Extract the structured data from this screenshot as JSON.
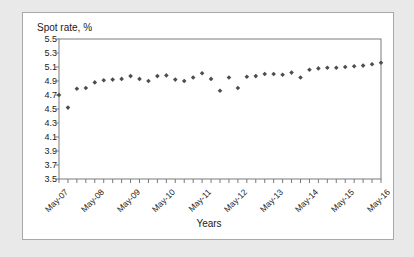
{
  "chart_data": {
    "type": "scatter",
    "title": "",
    "ylabel": "Spot rate, %",
    "xlabel": "Years",
    "ylim": [
      3.5,
      5.5
    ],
    "ytick_labels": [
      "5.5",
      "5.3",
      "5.1",
      "4.9",
      "4.7",
      "4.5",
      "4.3",
      "4.1",
      "3.9",
      "3.7",
      "3.5"
    ],
    "ytick_values": [
      5.5,
      5.3,
      5.1,
      4.9,
      4.7,
      4.5,
      4.3,
      4.1,
      3.9,
      3.7,
      3.5
    ],
    "xtick_labels": [
      "May-07",
      "May-08",
      "May-09",
      "May-10",
      "May-11",
      "May-12",
      "May-13",
      "May-14",
      "May-15",
      "May-16"
    ],
    "grid": false,
    "legend": "none",
    "marker_color": "#4d4d4d",
    "series_name": "Spot rate",
    "x": [
      "May-07",
      "Aug-07",
      "Nov-07",
      "Feb-08",
      "May-08",
      "Aug-08",
      "Nov-08",
      "Feb-09",
      "May-09",
      "Aug-09",
      "Nov-09",
      "Feb-10",
      "May-10",
      "Aug-10",
      "Nov-10",
      "Feb-11",
      "May-11",
      "Aug-11",
      "Nov-11",
      "Feb-12",
      "May-12",
      "Aug-12",
      "Nov-12",
      "Feb-13",
      "May-13",
      "Aug-13",
      "Nov-13",
      "Feb-14",
      "May-14",
      "Aug-14",
      "Nov-14",
      "Feb-15",
      "May-15",
      "Aug-15",
      "Nov-15",
      "Feb-16",
      "May-16"
    ],
    "values": [
      4.7,
      4.52,
      4.79,
      4.8,
      4.88,
      4.91,
      4.92,
      4.93,
      4.97,
      4.93,
      4.9,
      4.97,
      4.98,
      4.92,
      4.9,
      4.95,
      5.01,
      4.93,
      4.76,
      4.95,
      4.8,
      4.96,
      4.97,
      5.0,
      5.0,
      4.99,
      5.02,
      4.95,
      5.06,
      5.08,
      5.09,
      5.09,
      5.1,
      5.11,
      5.12,
      5.14,
      5.16
    ]
  }
}
